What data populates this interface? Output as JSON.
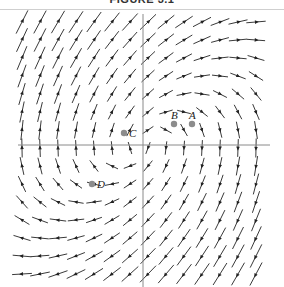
{
  "figure": {
    "title": "FIGURE 3.1",
    "axes": {
      "origin_px": [
        143,
        145
      ],
      "x_axis": {
        "x1": 18,
        "x2": 270
      },
      "y_axis": {
        "y1": 14,
        "y2": 287
      },
      "color": "#8a8a8a"
    },
    "field": {
      "equation": "dx/dt = y, dy/dt = -x + y",
      "grid_step_px": 18,
      "arrow_color": "#222222"
    },
    "points": [
      {
        "label": "A",
        "x": 192,
        "y": 124
      },
      {
        "label": "B",
        "x": 174,
        "y": 124
      },
      {
        "label": "C",
        "x": 124,
        "y": 133
      },
      {
        "label": "D",
        "x": 92,
        "y": 184
      }
    ],
    "point_color": "#8c8c8c"
  }
}
